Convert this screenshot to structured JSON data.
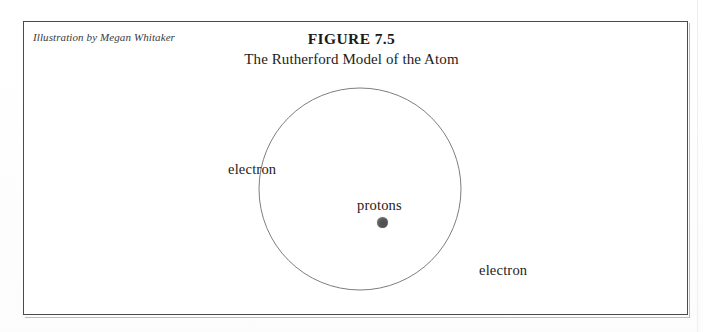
{
  "figure": {
    "attribution": "Illustration by Megan Whitaker",
    "title": "FIGURE 7.5",
    "subtitle": "The Rutherford Model of the Atom"
  },
  "diagram": {
    "type": "atomic-model-schematic",
    "orbit": {
      "shape": "circle",
      "center_x": 337,
      "center_y": 168,
      "radius": 101,
      "stroke_color": "#7d7d7d",
      "stroke_width": 1,
      "fill": "none"
    },
    "nucleus": {
      "label": "protons",
      "shape": "filled-circle",
      "center_x": 337,
      "center_y": 180,
      "radius": 5.5,
      "color": "#555555"
    },
    "labels": [
      {
        "text": "electron",
        "position": "upper-left"
      },
      {
        "text": "electron",
        "position": "lower-right"
      },
      {
        "text": "protons",
        "position": "center"
      }
    ]
  },
  "frame": {
    "border_color": "#4b4b4b",
    "background_color": "#ffffff"
  }
}
